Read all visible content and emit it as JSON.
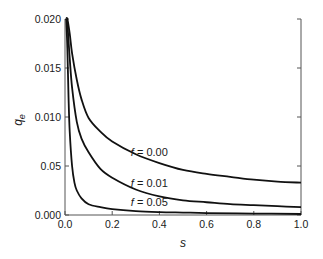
{
  "chart_data": {
    "type": "line",
    "title": "",
    "xlabel": "s",
    "ylabel": "q",
    "ylabel_subscript": "e",
    "xlim": [
      0.0,
      1.0
    ],
    "ylim": [
      0.0,
      0.02
    ],
    "grid": false,
    "legend_position": "inline labels near curves",
    "x_ticks": [
      "0.0",
      "0.2",
      "0.4",
      "0.6",
      "0.8",
      "1.0"
    ],
    "y_ticks": [
      "0.000",
      "0.05",
      "0.010",
      "0.015",
      "0.020"
    ],
    "y_tick_values": [
      0.0,
      0.005,
      0.01,
      0.015,
      0.02
    ],
    "series": [
      {
        "name": "f = 0.00",
        "label_prefix": "f",
        "label_value": " = 0.00",
        "x": [
          0.005,
          0.01,
          0.02,
          0.03,
          0.05,
          0.07,
          0.1,
          0.15,
          0.2,
          0.3,
          0.4,
          0.5,
          0.6,
          0.7,
          0.8,
          0.9,
          1.0
        ],
        "y": [
          0.02,
          0.02,
          0.0185,
          0.0165,
          0.0138,
          0.0118,
          0.0099,
          0.0085,
          0.0075,
          0.0062,
          0.0053,
          0.0046,
          0.0042,
          0.0039,
          0.0036,
          0.0034,
          0.0033
        ]
      },
      {
        "name": "f = 0.01",
        "label_prefix": "f",
        "label_value": " = 0.01",
        "x": [
          0.005,
          0.01,
          0.02,
          0.03,
          0.05,
          0.07,
          0.1,
          0.15,
          0.2,
          0.3,
          0.4,
          0.5,
          0.6,
          0.7,
          0.8,
          0.9,
          1.0
        ],
        "y": [
          0.02,
          0.0195,
          0.016,
          0.013,
          0.0095,
          0.0078,
          0.0064,
          0.0047,
          0.0038,
          0.0026,
          0.0019,
          0.0015,
          0.0013,
          0.0011,
          0.001,
          0.0009,
          0.0008
        ]
      },
      {
        "name": "f = 0.05",
        "label_prefix": "f",
        "label_value": " = 0.05",
        "x": [
          0.005,
          0.01,
          0.015,
          0.02,
          0.03,
          0.04,
          0.05,
          0.07,
          0.1,
          0.15,
          0.2,
          0.3,
          0.4,
          0.5,
          0.6,
          0.8,
          1.0
        ],
        "y": [
          0.02,
          0.017,
          0.012,
          0.0085,
          0.005,
          0.0033,
          0.0025,
          0.0017,
          0.0011,
          0.0008,
          0.0006,
          0.0004,
          0.0003,
          0.00025,
          0.0002,
          0.00015,
          0.0001
        ]
      }
    ],
    "label_positions": [
      {
        "x": 0.3,
        "y": 0.0064
      },
      {
        "x": 0.3,
        "y": 0.0033
      },
      {
        "x": 0.3,
        "y": 0.0013
      }
    ],
    "colors": {
      "curve": "#111111",
      "axis": "#555555",
      "text": "#1a1a1a"
    }
  }
}
